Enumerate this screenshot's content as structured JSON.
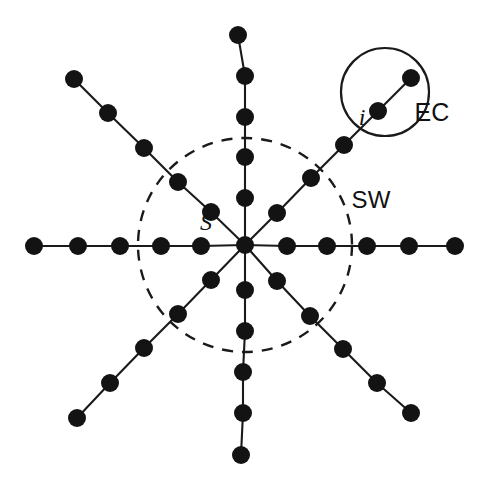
{
  "figure": {
    "type": "node-link-diagram",
    "background_color": "#ffffff",
    "node_color": "#131313",
    "edge_color": "#1a1a1a",
    "node_radius": 9,
    "edge_width": 2.1,
    "width": 490,
    "height": 487
  },
  "center": {
    "x": 245,
    "y": 245
  },
  "labels": [
    {
      "id": "label-s",
      "text": "S",
      "x": 206,
      "y": 222,
      "style": "italic-serif",
      "anchor": "center"
    },
    {
      "id": "label-i",
      "text": "i",
      "x": 362,
      "y": 117,
      "style": "italic-serif",
      "anchor": "center"
    },
    {
      "id": "label-sw",
      "text": "SW",
      "x": 371,
      "y": 200,
      "style": "upright-sans",
      "anchor": "center"
    },
    {
      "id": "label-ec",
      "text": "EC",
      "x": 432,
      "y": 112,
      "style": "upright-sans",
      "anchor": "center"
    }
  ],
  "boundaries": [
    {
      "id": "sw-boundary",
      "name": "SW",
      "shape": "circle",
      "cx": 245,
      "cy": 245,
      "r": 107,
      "stroke": "dashed",
      "dash": "11 9",
      "stroke_width": 2.4,
      "color": "#1a1a1a"
    },
    {
      "id": "ec-boundary",
      "name": "EC",
      "shape": "circle",
      "cx": 385,
      "cy": 92,
      "r": 44,
      "stroke": "solid",
      "stroke_width": 2.2,
      "color": "#1a1a1a"
    }
  ],
  "spokes": [
    {
      "id": "spoke-up",
      "direction": "up",
      "angle_deg": 90,
      "nodes": [
        {
          "x": 245,
          "y": 198
        },
        {
          "x": 245,
          "y": 157
        },
        {
          "x": 245,
          "y": 117
        },
        {
          "x": 245,
          "y": 76
        },
        {
          "x": 238,
          "y": 35
        }
      ]
    },
    {
      "id": "spoke-down",
      "direction": "down",
      "angle_deg": 270,
      "nodes": [
        {
          "x": 245,
          "y": 290
        },
        {
          "x": 245,
          "y": 331
        },
        {
          "x": 243,
          "y": 372
        },
        {
          "x": 243,
          "y": 413
        },
        {
          "x": 241,
          "y": 455
        }
      ]
    },
    {
      "id": "spoke-left",
      "direction": "left",
      "angle_deg": 180,
      "nodes": [
        {
          "x": 201,
          "y": 246
        },
        {
          "x": 161,
          "y": 246
        },
        {
          "x": 120,
          "y": 246
        },
        {
          "x": 78,
          "y": 246
        },
        {
          "x": 34,
          "y": 246
        }
      ]
    },
    {
      "id": "spoke-right",
      "direction": "right",
      "angle_deg": 0,
      "nodes": [
        {
          "x": 287,
          "y": 246
        },
        {
          "x": 327,
          "y": 246
        },
        {
          "x": 367,
          "y": 246
        },
        {
          "x": 409,
          "y": 246
        },
        {
          "x": 455,
          "y": 246
        }
      ]
    },
    {
      "id": "spoke-upper-left",
      "direction": "upper-left",
      "angle_deg": 135,
      "nodes": [
        {
          "x": 211,
          "y": 212
        },
        {
          "x": 178,
          "y": 182
        },
        {
          "x": 144,
          "y": 148
        },
        {
          "x": 108,
          "y": 113
        },
        {
          "x": 74,
          "y": 79
        }
      ]
    },
    {
      "id": "spoke-upper-right",
      "direction": "upper-right",
      "angle_deg": 45,
      "nodes": [
        {
          "x": 277,
          "y": 213
        },
        {
          "x": 311,
          "y": 178
        },
        {
          "x": 344,
          "y": 145
        },
        {
          "x": 378,
          "y": 111
        },
        {
          "x": 411,
          "y": 78
        }
      ],
      "highlighted_node_index": 2,
      "highlighted_node_label": "i",
      "enclosed_by_ec": [
        3,
        4
      ]
    },
    {
      "id": "spoke-lower-left",
      "direction": "lower-left",
      "angle_deg": 225,
      "nodes": [
        {
          "x": 211,
          "y": 280
        },
        {
          "x": 178,
          "y": 314
        },
        {
          "x": 144,
          "y": 348
        },
        {
          "x": 110,
          "y": 383
        },
        {
          "x": 77,
          "y": 418
        }
      ]
    },
    {
      "id": "spoke-lower-right",
      "direction": "lower-right",
      "angle_deg": 315,
      "nodes": [
        {
          "x": 277,
          "y": 281
        },
        {
          "x": 310,
          "y": 316
        },
        {
          "x": 343,
          "y": 349
        },
        {
          "x": 377,
          "y": 383
        },
        {
          "x": 411,
          "y": 413
        }
      ]
    }
  ]
}
